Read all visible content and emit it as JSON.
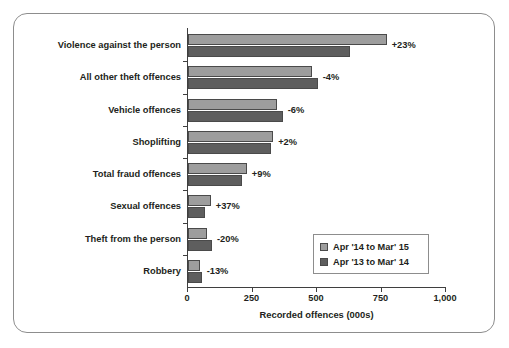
{
  "chart_data": {
    "type": "bar",
    "orientation": "horizontal",
    "title": "",
    "xlabel": "Recorded offences (000s)",
    "ylabel": "",
    "xlim": [
      0,
      1000
    ],
    "xticks": [
      0,
      250,
      500,
      750,
      1000
    ],
    "xticklabels": [
      "0",
      "250",
      "500",
      "750",
      "1,000"
    ],
    "grid": false,
    "legend_position": "lower-right",
    "categories": [
      "Violence against the person",
      "All other theft offences",
      "Vehicle offences",
      "Shoplifting",
      "Total fraud offences",
      "Sexual offences",
      "Theft from the person",
      "Robbery"
    ],
    "series": [
      {
        "name": "Apr '14 to Mar' 15",
        "color": "#9d9d9d",
        "values": [
          770,
          482,
          344,
          330,
          228,
          88,
          74,
          46
        ]
      },
      {
        "name": "Apr '13 to Mar' 14",
        "color": "#5e5e5e",
        "values": [
          626,
          503,
          367,
          323,
          209,
          64,
          93,
          53
        ]
      }
    ],
    "annotations": [
      "+23%",
      "-4%",
      "-6%",
      "+2%",
      "+9%",
      "+37%",
      "-20%",
      "-13%"
    ]
  },
  "legend": {
    "items": [
      {
        "label": "Apr '14 to Mar' 15",
        "color": "#9d9d9d"
      },
      {
        "label": "Apr '13 to Mar' 14",
        "color": "#5e5e5e"
      }
    ]
  }
}
